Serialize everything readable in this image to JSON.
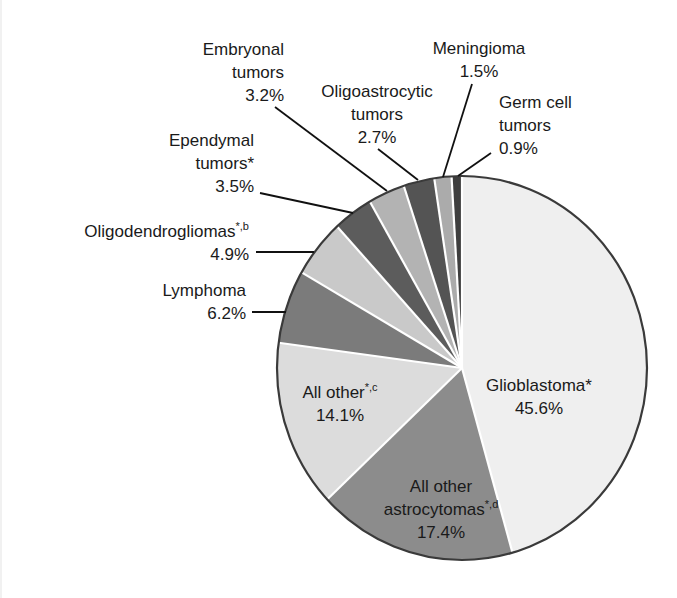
{
  "chart_data": {
    "type": "pie",
    "title": "",
    "start": "top",
    "direction": "clockwise",
    "slices": [
      {
        "name": "Glioblastoma",
        "sup": "*",
        "label_lines": [
          "Glioblastoma*"
        ],
        "value": 45.6,
        "value_label": "45.6%",
        "color": "#efefef",
        "label_position": "inside"
      },
      {
        "name": "All other astrocytomas",
        "sup": "*,d",
        "label_lines": [
          "All other",
          "astrocytomas"
        ],
        "value": 17.4,
        "value_label": "17.4%",
        "color": "#8c8c8c",
        "label_position": "inside"
      },
      {
        "name": "All other",
        "sup": "*,c",
        "label_lines": [
          "All other"
        ],
        "value": 14.1,
        "value_label": "14.1%",
        "color": "#dcdcdc",
        "label_position": "inside"
      },
      {
        "name": "Lymphoma",
        "sup": "",
        "label_lines": [
          "Lymphoma"
        ],
        "value": 6.2,
        "value_label": "6.2%",
        "color": "#7b7b7b",
        "label_position": "outside-left"
      },
      {
        "name": "Oligodendrogliomas",
        "sup": "*,b",
        "label_lines": [
          "Oligodendrogliomas"
        ],
        "value": 4.9,
        "value_label": "4.9%",
        "color": "#c9c9c9",
        "label_position": "outside-left"
      },
      {
        "name": "Ependymal tumors",
        "sup": "*",
        "label_lines": [
          "Ependymal",
          "tumors*"
        ],
        "value": 3.5,
        "value_label": "3.5%",
        "color": "#5c5c5c",
        "label_position": "outside-left"
      },
      {
        "name": "Embryonal tumors",
        "sup": "",
        "label_lines": [
          "Embryonal",
          "tumors"
        ],
        "value": 3.2,
        "value_label": "3.2%",
        "color": "#b3b3b3",
        "label_position": "outside-top"
      },
      {
        "name": "Oligoastrocytic tumors",
        "sup": "",
        "label_lines": [
          "Oligoastrocytic",
          "tumors"
        ],
        "value": 2.7,
        "value_label": "2.7%",
        "color": "#545454",
        "label_position": "outside-top"
      },
      {
        "name": "Meningioma",
        "sup": "",
        "label_lines": [
          "Meningioma"
        ],
        "value": 1.5,
        "value_label": "1.5%",
        "color": "#ababab",
        "label_position": "outside-top"
      },
      {
        "name": "Germ cell tumors",
        "sup": "",
        "label_lines": [
          "Germ cell",
          "tumors"
        ],
        "value": 0.9,
        "value_label": "0.9%",
        "color": "#3e3e3e",
        "label_position": "outside-top-right"
      }
    ],
    "categories": [
      "Glioblastoma",
      "All other astrocytomas",
      "All other",
      "Lymphoma",
      "Oligodendrogliomas",
      "Ependymal tumors",
      "Embryonal tumors",
      "Oligoastrocytic tumors",
      "Meningioma",
      "Germ cell tumors"
    ],
    "values": [
      45.6,
      17.4,
      14.1,
      6.2,
      4.9,
      3.5,
      3.2,
      2.7,
      1.5,
      0.9
    ],
    "legend": "none",
    "unit": "%"
  }
}
